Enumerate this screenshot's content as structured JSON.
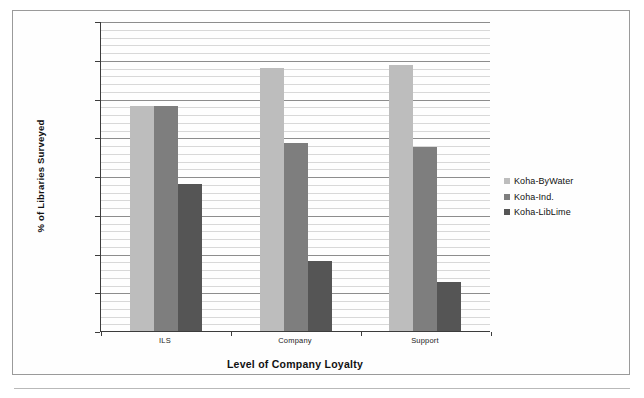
{
  "chart_data": {
    "type": "bar",
    "title": "",
    "subtitle": "",
    "xlabel": "Level of Company Loyalty",
    "ylabel": "% of Libraries Surveyed",
    "categories": [
      "ILS",
      "Company",
      "Support"
    ],
    "series": [
      {
        "name": "Koha-ByWater",
        "color": "#bdbdbd",
        "values": [
          7.9,
          8.4,
          8.43
        ]
      },
      {
        "name": "Koha-Ind.",
        "color": "#7e7e7e",
        "values": [
          7.9,
          7.43,
          7.38
        ]
      },
      {
        "name": "Koha-LibLime",
        "color": "#555555",
        "values": [
          6.9,
          5.9,
          5.63
        ]
      }
    ],
    "ylim": [
      5,
      9
    ],
    "ytick_step": 0.5,
    "yticks": [
      "9",
      "8.5",
      "8",
      "7.5",
      "7",
      "6.5",
      "6",
      "5.5",
      "5"
    ],
    "minor_gridline_step": 0.1,
    "grid": true,
    "legend_position": "right"
  }
}
